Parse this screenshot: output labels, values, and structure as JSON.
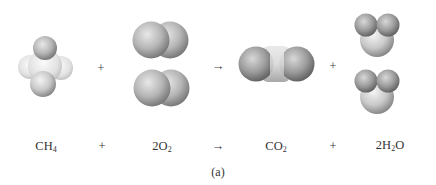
{
  "figure": {
    "caption": "(a)",
    "equation": {
      "terms": [
        {
          "formula": "CH",
          "sub": "4",
          "coef": "",
          "x": 46
        },
        {
          "formula": "O",
          "sub": "2",
          "coef": "2",
          "x": 162
        },
        {
          "formula": "CO",
          "sub": "2",
          "coef": "",
          "x": 276
        },
        {
          "formula": "H",
          "sub": "2",
          "after": "O",
          "coef": "2",
          "x": 388
        }
      ],
      "operators": [
        {
          "symbol": "+",
          "x": 102
        },
        {
          "symbol": "→",
          "x": 218
        },
        {
          "symbol": "+",
          "x": 333
        }
      ]
    },
    "models": {
      "row_operators": [
        {
          "symbol": "+",
          "x": 101,
          "y": 68
        },
        {
          "symbol": "→",
          "x": 218,
          "y": 67
        },
        {
          "symbol": "+",
          "x": 333,
          "y": 66
        }
      ],
      "molecules": [
        {
          "name": "methane",
          "count": 1
        },
        {
          "name": "oxygen",
          "count": 2
        },
        {
          "name": "carbon-dioxide",
          "count": 1
        },
        {
          "name": "water",
          "count": 2
        }
      ]
    }
  }
}
